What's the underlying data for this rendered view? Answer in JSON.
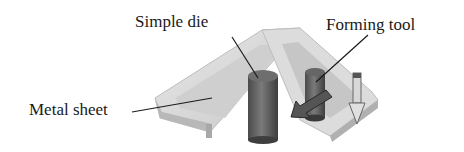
{
  "figure": {
    "labels": {
      "simple_die": "Simple die",
      "forming_tool": "Forming tool",
      "metal_sheet": "Metal sheet"
    },
    "colors": {
      "sheet_light": "#e6e6e6",
      "sheet_mid": "#cfcfcf",
      "sheet_dark": "#b5b5b5",
      "cylinder": "#6a6a6a",
      "cylinder_dark": "#4a4a4a",
      "leader_line": "#1a1a1a"
    }
  }
}
